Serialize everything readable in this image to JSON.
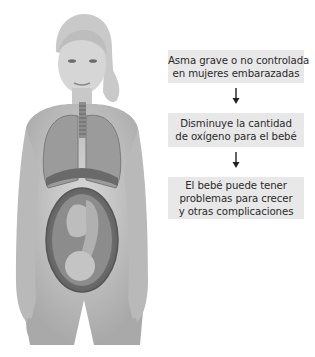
{
  "figure": {
    "icon": "pregnant-woman-anatomy-illustration"
  },
  "flow": {
    "steps": [
      {
        "lines": [
          "Asma grave o no controlada",
          "en mujeres embarazadas"
        ]
      },
      {
        "lines": [
          "Disminuye la cantidad",
          "de oxígeno para el bebé"
        ]
      },
      {
        "lines": [
          "El bebé puede tener",
          "problemas para crecer",
          "y otras complicaciones"
        ]
      }
    ],
    "arrow_icon": "arrow-down-icon",
    "box_color": "#e8e8e8",
    "text_color": "#2a2a2a"
  }
}
